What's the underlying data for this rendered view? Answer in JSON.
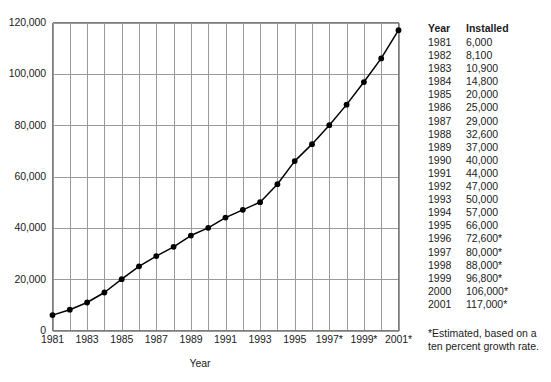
{
  "chart_data": {
    "type": "line",
    "title": "",
    "xlabel": "Year",
    "ylabel": "",
    "grid": true,
    "legend": "none",
    "xlim": [
      1981,
      2001
    ],
    "ylim": [
      0,
      120000
    ],
    "x": [
      1981,
      1982,
      1983,
      1984,
      1985,
      1986,
      1987,
      1988,
      1989,
      1990,
      1991,
      1992,
      1993,
      1994,
      1995,
      1996,
      1997,
      1998,
      1999,
      2000,
      2001
    ],
    "values": [
      6000,
      8100,
      10900,
      14800,
      20000,
      25000,
      29000,
      32600,
      37000,
      40000,
      44000,
      47000,
      50000,
      57000,
      66000,
      72600,
      80000,
      88000,
      96800,
      106000,
      117000
    ],
    "series": [
      {
        "name": "Installed",
        "values": [
          6000,
          8100,
          10900,
          14800,
          20000,
          25000,
          29000,
          32600,
          37000,
          40000,
          44000,
          47000,
          50000,
          57000,
          66000,
          72600,
          80000,
          88000,
          96800,
          106000,
          117000
        ],
        "color": "#000000",
        "marker": "filled-circle"
      }
    ],
    "ytick_labels": [
      "0",
      "20,000",
      "40,000",
      "60,000",
      "80,000",
      "100,000",
      "120,000"
    ],
    "ytick_values": [
      0,
      20000,
      40000,
      60000,
      80000,
      100000,
      120000
    ],
    "xtick_labels": [
      "1981",
      "1983",
      "1985",
      "1987",
      "1989",
      "1991",
      "1993",
      "1995",
      "1997*",
      "1999*",
      "2001*"
    ],
    "xtick_values": [
      1981,
      1983,
      1985,
      1987,
      1989,
      1991,
      1993,
      1995,
      1997,
      1999,
      2001
    ],
    "gridline_color": "#9a9a9a",
    "axis_color": "#7d7d7d",
    "line_color": "#000000"
  },
  "axis": {
    "x_title": "Year"
  },
  "table": {
    "headers": [
      "Year",
      "Installed"
    ],
    "rows": [
      [
        "1981",
        "6,000"
      ],
      [
        "1982",
        "8,100"
      ],
      [
        "1983",
        "10,900"
      ],
      [
        "1984",
        "14,800"
      ],
      [
        "1985",
        "20,000"
      ],
      [
        "1986",
        "25,000"
      ],
      [
        "1987",
        "29,000"
      ],
      [
        "1988",
        "32,600"
      ],
      [
        "1989",
        "37,000"
      ],
      [
        "1990",
        "40,000"
      ],
      [
        "1991",
        "44,000"
      ],
      [
        "1992",
        "47,000"
      ],
      [
        "1993",
        "50,000"
      ],
      [
        "1994",
        "57,000"
      ],
      [
        "1995",
        "66,000"
      ],
      [
        "1996",
        "72,600*"
      ],
      [
        "1997",
        "80,000*"
      ],
      [
        "1998",
        "88,000*"
      ],
      [
        "1999",
        "96,800*"
      ],
      [
        "2000",
        "106,000*"
      ],
      [
        "2001",
        "117,000*"
      ]
    ],
    "footnote": "*Estimated, based on a ten percent growth rate."
  }
}
